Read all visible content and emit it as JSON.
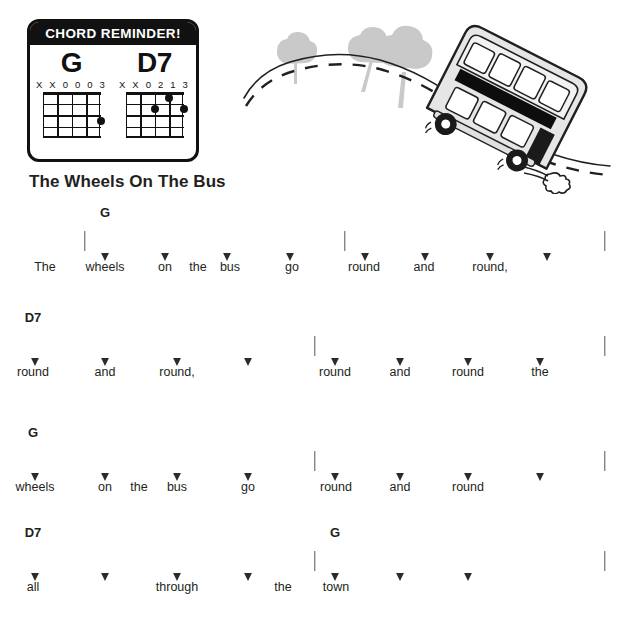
{
  "chord_reminder": {
    "header": "CHORD REMINDER!",
    "chords": [
      {
        "name": "G",
        "fingering": "X X 0 0 0 3",
        "strings": 5,
        "frets": 4,
        "dots": [
          {
            "string": 5,
            "fret": 3
          }
        ]
      },
      {
        "name": "D7",
        "fingering": "X X 0 2 1 3",
        "strings": 5,
        "frets": 4,
        "dots": [
          {
            "string": 4,
            "fret": 1
          },
          {
            "string": 3,
            "fret": 2
          },
          {
            "string": 5,
            "fret": 2
          }
        ]
      }
    ]
  },
  "illustration": {
    "name": "double-decker-bus-on-hill",
    "elements": [
      "tree",
      "tree",
      "tree",
      "dashed-road",
      "double-decker-bus",
      "exhaust-puff"
    ],
    "bus_body_color": "#e9e9e9",
    "outline_color": "#231f20",
    "tree_color": "#c9c9c9"
  },
  "song": {
    "title": "The Wheels On The Bus"
  },
  "lines": [
    {
      "id": "line-1",
      "top": 205,
      "chords": [
        {
          "label": "G",
          "x": 105
        }
      ],
      "bars": [
        {
          "x": 85
        },
        {
          "x": 345
        },
        {
          "x": 605
        }
      ],
      "arrows": [
        {
          "x": 105
        },
        {
          "x": 165
        },
        {
          "x": 227
        },
        {
          "x": 290
        },
        {
          "x": 365
        },
        {
          "x": 425
        },
        {
          "x": 490
        },
        {
          "x": 547
        }
      ],
      "lyrics": [
        {
          "text": "The",
          "x": 45
        },
        {
          "text": "wheels",
          "x": 105
        },
        {
          "text": "on",
          "x": 165
        },
        {
          "text": "the",
          "x": 198
        },
        {
          "text": "bus",
          "x": 230
        },
        {
          "text": "go",
          "x": 292
        },
        {
          "text": "round",
          "x": 364
        },
        {
          "text": "and",
          "x": 424
        },
        {
          "text": "round,",
          "x": 490
        }
      ]
    },
    {
      "id": "line-2",
      "top": 310,
      "chords": [
        {
          "label": "D7",
          "x": 33
        }
      ],
      "bars": [
        {
          "x": 315
        },
        {
          "x": 605
        }
      ],
      "arrows": [
        {
          "x": 35
        },
        {
          "x": 105
        },
        {
          "x": 177
        },
        {
          "x": 248
        },
        {
          "x": 335
        },
        {
          "x": 400
        },
        {
          "x": 468
        },
        {
          "x": 540
        }
      ],
      "lyrics": [
        {
          "text": "round",
          "x": 33
        },
        {
          "text": "and",
          "x": 105
        },
        {
          "text": "round,",
          "x": 177
        },
        {
          "text": "round",
          "x": 335
        },
        {
          "text": "and",
          "x": 400
        },
        {
          "text": "round",
          "x": 468
        },
        {
          "text": "the",
          "x": 540
        }
      ]
    },
    {
      "id": "line-3",
      "top": 425,
      "chords": [
        {
          "label": "G",
          "x": 33
        }
      ],
      "bars": [
        {
          "x": 315
        },
        {
          "x": 605
        }
      ],
      "arrows": [
        {
          "x": 35
        },
        {
          "x": 105
        },
        {
          "x": 177
        },
        {
          "x": 248
        },
        {
          "x": 335
        },
        {
          "x": 400
        },
        {
          "x": 468
        },
        {
          "x": 540
        }
      ],
      "lyrics": [
        {
          "text": "wheels",
          "x": 35
        },
        {
          "text": "on",
          "x": 105
        },
        {
          "text": "the",
          "x": 139
        },
        {
          "text": "bus",
          "x": 177
        },
        {
          "text": "go",
          "x": 248
        },
        {
          "text": "round",
          "x": 336
        },
        {
          "text": "and",
          "x": 400
        },
        {
          "text": "round",
          "x": 468
        }
      ]
    },
    {
      "id": "line-4",
      "top": 525,
      "chords": [
        {
          "label": "D7",
          "x": 33
        },
        {
          "label": "G",
          "x": 335
        }
      ],
      "bars": [
        {
          "x": 315
        },
        {
          "x": 605
        }
      ],
      "arrows": [
        {
          "x": 35
        },
        {
          "x": 105
        },
        {
          "x": 177
        },
        {
          "x": 248
        },
        {
          "x": 335
        },
        {
          "x": 400
        },
        {
          "x": 468
        }
      ],
      "lyrics": [
        {
          "text": "all",
          "x": 33
        },
        {
          "text": "through",
          "x": 177
        },
        {
          "text": "the",
          "x": 283
        },
        {
          "text": "town",
          "x": 336
        }
      ]
    }
  ]
}
